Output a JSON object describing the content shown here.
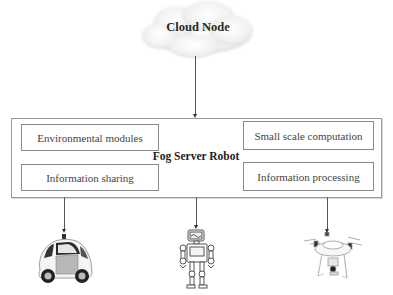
{
  "diagram": {
    "cloud": {
      "label": "Cloud Node"
    },
    "fog_server": {
      "label": "Fog Server Robot",
      "modules_left": [
        {
          "label": "Environmental modules"
        },
        {
          "label": "Information sharing"
        }
      ],
      "modules_right": [
        {
          "label": "Small scale computation"
        },
        {
          "label": "Information processing"
        }
      ]
    },
    "devices": [
      {
        "name": "self-driving car",
        "icon": "car-icon"
      },
      {
        "name": "humanoid robot",
        "icon": "robot-icon"
      },
      {
        "name": "quadcopter drone",
        "icon": "drone-icon"
      }
    ],
    "edges": [
      {
        "from": "Cloud Node",
        "to": "Fog Server Robot"
      },
      {
        "from": "Fog Server Robot",
        "to": "self-driving car"
      },
      {
        "from": "Fog Server Robot",
        "to": "humanoid robot"
      },
      {
        "from": "Fog Server Robot",
        "to": "quadcopter drone"
      }
    ]
  }
}
